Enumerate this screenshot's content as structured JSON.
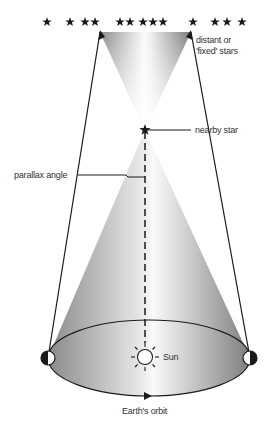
{
  "diagram": {
    "labels": {
      "distant_stars_line1": "distant or",
      "distant_stars_line2": "'fixed' stars",
      "nearby_star": "nearby star",
      "parallax_angle": "parallax angle",
      "sun": "Sun",
      "earth_orbit": "Earth's orbit"
    },
    "background_stars_x": [
      47,
      70,
      85,
      95,
      120,
      130,
      143,
      153,
      163,
      193,
      215,
      227,
      242
    ],
    "nodes": [
      "distant stars",
      "nearby star",
      "Sun",
      "Earth (left position)",
      "Earth (right position)"
    ],
    "edges": [
      {
        "from": "Earth (left position)",
        "to": "distant stars",
        "via": "nearby star"
      },
      {
        "from": "Earth (right position)",
        "to": "distant stars",
        "via": "nearby star"
      },
      {
        "from": "Sun",
        "to": "nearby star",
        "style": "dashed"
      }
    ],
    "colors": {
      "line": "#1a1a1a",
      "shade_dark": "#8a8a8a",
      "shade_light": "#f4f4f4",
      "text": "#333333"
    }
  }
}
